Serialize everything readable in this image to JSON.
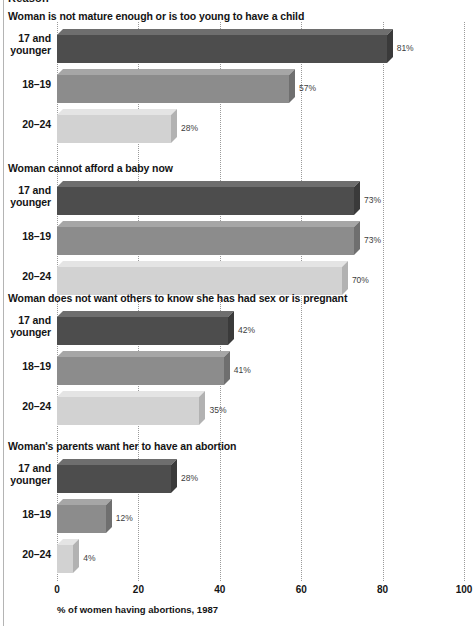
{
  "clipped_header": "Reason",
  "axis": {
    "caption": "% of women having abortions, 1987",
    "ticks": [
      0,
      20,
      40,
      60,
      80,
      100
    ],
    "min": 0,
    "max": 100
  },
  "chart_data": {
    "type": "bar",
    "title": "Reason",
    "xlabel": "% of women having abortions, 1987",
    "ylabel": "",
    "xlim": [
      0,
      100
    ],
    "grid": true,
    "orientation": "horizontal",
    "legend": "none",
    "categories": [
      "17 and younger",
      "18-19",
      "20-24"
    ],
    "groups": [
      {
        "title": "Woman is not mature enough or is too young to have a child",
        "bars": [
          {
            "category": "17 and younger",
            "label_line1": "17 and",
            "label_line2": "younger",
            "value": 81,
            "value_label": "81%",
            "shade": "dark"
          },
          {
            "category": "18-19",
            "label_line1": "18–19",
            "label_line2": "",
            "value": 57,
            "value_label": "57%",
            "shade": "mid"
          },
          {
            "category": "20-24",
            "label_line1": "20–24",
            "label_line2": "",
            "value": 28,
            "value_label": "28%",
            "shade": "light"
          }
        ]
      },
      {
        "title": "Woman cannot afford a baby now",
        "bars": [
          {
            "category": "17 and younger",
            "label_line1": "17 and",
            "label_line2": "younger",
            "value": 73,
            "value_label": "73%",
            "shade": "dark"
          },
          {
            "category": "18-19",
            "label_line1": "18–19",
            "label_line2": "",
            "value": 73,
            "value_label": "73%",
            "shade": "mid"
          },
          {
            "category": "20-24",
            "label_line1": "20–24",
            "label_line2": "",
            "value": 70,
            "value_label": "70%",
            "shade": "light"
          }
        ]
      },
      {
        "title": "Woman does not want others to know she has had sex or is pregnant",
        "bars": [
          {
            "category": "17 and younger",
            "label_line1": "17 and",
            "label_line2": "younger",
            "value": 42,
            "value_label": "42%",
            "shade": "dark"
          },
          {
            "category": "18-19",
            "label_line1": "18–19",
            "label_line2": "",
            "value": 41,
            "value_label": "41%",
            "shade": "mid"
          },
          {
            "category": "20-24",
            "label_line1": "20–24",
            "label_line2": "",
            "value": 35,
            "value_label": "35%",
            "shade": "light"
          }
        ]
      },
      {
        "title": "Woman's parents want her to have an abortion",
        "bars": [
          {
            "category": "17 and younger",
            "label_line1": "17 and",
            "label_line2": "younger",
            "value": 28,
            "value_label": "28%",
            "shade": "dark"
          },
          {
            "category": "18-19",
            "label_line1": "18–19",
            "label_line2": "",
            "value": 12,
            "value_label": "12%",
            "shade": "mid"
          },
          {
            "category": "20-24",
            "label_line1": "20–24",
            "label_line2": "",
            "value": 4,
            "value_label": "4%",
            "shade": "light"
          }
        ]
      }
    ]
  }
}
